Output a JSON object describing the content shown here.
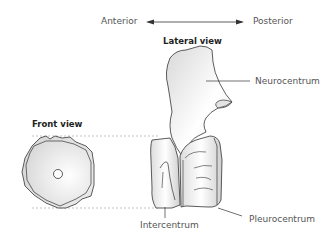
{
  "axis": {
    "left_label": "Anterior",
    "right_label": "Posterior",
    "arrow": "double-headed-arrow"
  },
  "views": {
    "lateral_title": "Lateral view",
    "front_title": "Front view"
  },
  "labels": {
    "neurocentrum": "Neurocentrum",
    "intercentrum": "Intercentrum",
    "pleurocentrum": "Pleurocentrum"
  },
  "colors": {
    "line": "#333333",
    "text": "#555555",
    "title": "#222222",
    "dashed": "#aaaaaa",
    "shade": "#d9d9d9"
  }
}
